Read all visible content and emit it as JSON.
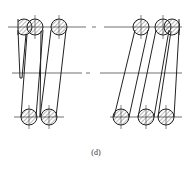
{
  "figure": {
    "caption": "(d)",
    "colors": {
      "line": "#222222",
      "hatch": "#555555",
      "background": "#ffffff"
    }
  }
}
